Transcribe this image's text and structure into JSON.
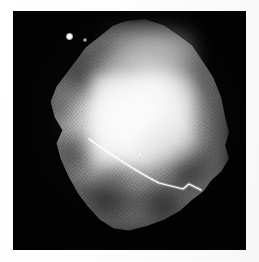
{
  "image": {
    "kind": "radiograph",
    "modality_hint": "grayscale x-ray / mammographic specimen image",
    "plate_background_color": "#020202",
    "paper_background_color": "#fdfdfd",
    "canvas_width_px": 259,
    "canvas_height_px": 262,
    "plate": {
      "left_px": 13,
      "top_px": 11,
      "width_px": 233,
      "height_px": 239
    },
    "subject": {
      "name": "tissue-mass",
      "description": "irregular lobulated bright soft-tissue mass occupying the centre of the plate",
      "brightest_color": "#f6f6f6",
      "midtone_color": "#b4b4b4",
      "shadow_color": "#5a5a5a",
      "bounds": {
        "left_px": 35,
        "top_px": 19,
        "right_px": 231,
        "bottom_px": 234
      }
    },
    "markers": [
      {
        "name": "calcification-bright-dot",
        "color": "#ffffff",
        "x_px": 69,
        "y_px": 36,
        "diameter_px": 7
      },
      {
        "name": "calcification-small-dot",
        "color": "#fafafa",
        "x_px": 85,
        "y_px": 40,
        "diameter_px": 4
      },
      {
        "name": "calcification-streak",
        "color": "#fcfcfc",
        "x_px": 139,
        "y_px": 152,
        "diameter_px": 5
      }
    ],
    "wire": {
      "name": "localization-wire",
      "color": "#ffffff",
      "stroke_width_px": 1.1,
      "description": "thin bright hooked localization wire crossing the lower half of the mass from upper-left to lower-right",
      "path": "M 76 128 C 96 142, 122 160, 146 172 L 170 178 L 176 173 L 188 179"
    },
    "texture": {
      "name": "diagonal-striation-grid",
      "primary_angle_deg": 52,
      "secondary_angle_deg": -40,
      "spacing_px": 2.6,
      "opacity": 0.75
    }
  }
}
